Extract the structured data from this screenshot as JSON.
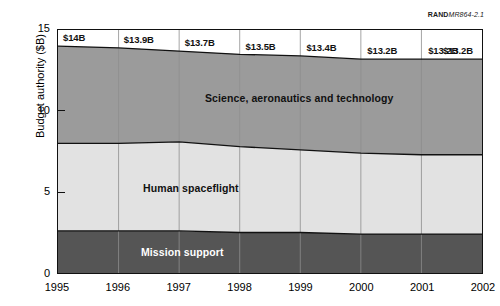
{
  "source_tag": {
    "org": "RAND",
    "number": "MR864-2.1"
  },
  "axes": {
    "ylabel": "Budget authority ($B)",
    "yticks": [
      "0",
      "5",
      "10",
      "15"
    ],
    "ytick_values": [
      0,
      5,
      10,
      15
    ],
    "ylim": [
      0,
      15
    ],
    "xticks": [
      "1995",
      "1996",
      "1997",
      "1998",
      "1999",
      "2000",
      "2001",
      "2002"
    ]
  },
  "total_labels": [
    "$14B",
    "$13.9B",
    "$13.7B",
    "$13.5B",
    "$13.4B",
    "$13.2B",
    "$13.2B",
    "$13.2B"
  ],
  "band_labels": {
    "science": "Science, aeronautics and technology",
    "human": "Human spaceflight",
    "mission": "Mission support"
  },
  "colors": {
    "science": "#9b9b9b",
    "human": "#e2e2e2",
    "mission": "#555555",
    "outline": "#111111",
    "gridline": "#8d8d8d"
  },
  "chart_data": {
    "type": "area",
    "title": "",
    "xlabel": "",
    "ylabel": "Budget authority ($B)",
    "x": [
      1995,
      1996,
      1997,
      1998,
      1999,
      2000,
      2001,
      2002
    ],
    "ylim": [
      0,
      15
    ],
    "xlim": [
      1995,
      2002
    ],
    "grid": "vertical",
    "legend": "inline-band-labels",
    "stacked": true,
    "totals": [
      14.0,
      13.9,
      13.7,
      13.5,
      13.4,
      13.2,
      13.2,
      13.2
    ],
    "series": [
      {
        "name": "Mission support",
        "values": [
          2.6,
          2.6,
          2.6,
          2.5,
          2.5,
          2.4,
          2.4,
          2.4
        ]
      },
      {
        "name": "Human spaceflight",
        "values": [
          5.4,
          5.4,
          5.5,
          5.3,
          5.1,
          5.0,
          4.9,
          4.9
        ]
      },
      {
        "name": "Science, aeronautics and technology",
        "values": [
          6.0,
          5.9,
          5.6,
          5.7,
          5.8,
          5.8,
          5.9,
          5.9
        ]
      }
    ],
    "cumulative_boundaries": {
      "mission_top": [
        2.6,
        2.6,
        2.6,
        2.5,
        2.5,
        2.4,
        2.4,
        2.4
      ],
      "human_top": [
        8.0,
        8.0,
        8.1,
        7.8,
        7.6,
        7.4,
        7.3,
        7.3
      ],
      "science_top": [
        14.0,
        13.9,
        13.7,
        13.5,
        13.4,
        13.2,
        13.2,
        13.2
      ]
    }
  }
}
